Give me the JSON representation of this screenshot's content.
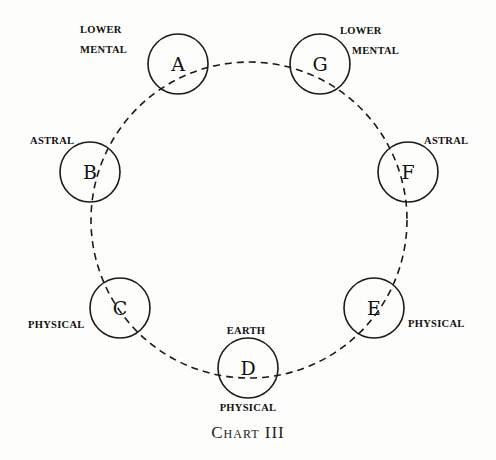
{
  "diagram": {
    "caption": "Chart III",
    "ring": {
      "cx": 249,
      "cy": 220,
      "r": 158,
      "style": "dashed"
    },
    "nodes": [
      {
        "id": "A",
        "letter": "A",
        "cx": 178,
        "cy": 64,
        "labels": [
          "LOWER",
          "MENTAL"
        ],
        "label_side": "upper-left"
      },
      {
        "id": "G",
        "letter": "G",
        "cx": 320,
        "cy": 64,
        "labels": [
          "LOWER",
          "MENTAL"
        ],
        "label_side": "upper-right"
      },
      {
        "id": "B",
        "letter": "B",
        "cx": 90,
        "cy": 172,
        "labels": [
          "ASTRAL"
        ],
        "label_side": "upper-left"
      },
      {
        "id": "F",
        "letter": "F",
        "cx": 408,
        "cy": 172,
        "labels": [
          "ASTRAL"
        ],
        "label_side": "upper-right"
      },
      {
        "id": "C",
        "letter": "C",
        "cx": 120,
        "cy": 308,
        "labels": [
          "PHYSICAL"
        ],
        "label_side": "left"
      },
      {
        "id": "E",
        "letter": "E",
        "cx": 374,
        "cy": 308,
        "labels": [
          "PHYSICAL"
        ],
        "label_side": "right"
      },
      {
        "id": "D",
        "letter": "D",
        "cx": 248,
        "cy": 368,
        "labels": [
          "EARTH",
          "PHYSICAL"
        ],
        "label_side": "above-below"
      }
    ],
    "node_radius": 30
  },
  "labels": {
    "a_line1": "LOWER",
    "a_line2": "MENTAL",
    "g_line1": "LOWER",
    "g_line2": "MENTAL",
    "b": "ASTRAL",
    "f": "ASTRAL",
    "c": "PHYSICAL",
    "e": "PHYSICAL",
    "d_above": "EARTH",
    "d_below": "PHYSICAL",
    "letters": {
      "a": "A",
      "b": "B",
      "c": "C",
      "d": "D",
      "e": "E",
      "f": "F",
      "g": "G"
    }
  }
}
